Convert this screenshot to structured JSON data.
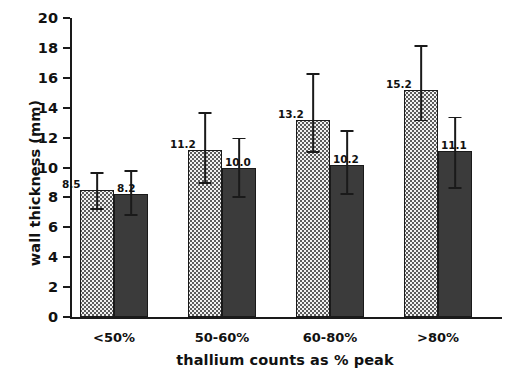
{
  "chart_data": {
    "type": "bar",
    "title": "",
    "xlabel": "thallium counts as % peak",
    "ylabel": "wall thickness (mm)",
    "categories": [
      "<50%",
      "50-60%",
      "60-80%",
      ">80%"
    ],
    "ylim": [
      0,
      20
    ],
    "ytick_labels": [
      "0",
      "2",
      "4",
      "6",
      "8",
      "10",
      "12",
      "14",
      "16",
      "18",
      "20"
    ],
    "ytick_values": [
      0,
      2,
      4,
      6,
      8,
      10,
      12,
      14,
      16,
      18,
      20
    ],
    "grid": false,
    "legend": "none",
    "series": [
      {
        "name": "series-light",
        "fill": "dotted-stipple",
        "color": "#f2f2f2",
        "values": [
          8.5,
          11.2,
          13.2,
          15.2
        ],
        "value_labels": [
          "8.5",
          "11.2",
          "13.2",
          "15.2"
        ],
        "err_low": [
          7.3,
          9.0,
          11.1,
          13.2
        ],
        "err_high": [
          9.7,
          13.7,
          16.3,
          18.2
        ]
      },
      {
        "name": "series-dark",
        "fill": "solid",
        "color": "#3b3b3b",
        "values": [
          8.2,
          10.0,
          10.2,
          11.1
        ],
        "value_labels": [
          "8.2",
          "10.0",
          "10.2",
          "11.1"
        ],
        "err_low": [
          6.9,
          8.1,
          8.3,
          8.7
        ],
        "err_high": [
          9.8,
          12.0,
          12.5,
          13.4
        ]
      }
    ]
  },
  "axis": {
    "y_title": "wall thickness (mm)",
    "x_title": "thallium counts as % peak"
  },
  "colors": {
    "axis": "#1a1a1a",
    "light_bar": "#f2f2f2",
    "dark_bar": "#3b3b3b",
    "text": "#111111"
  }
}
